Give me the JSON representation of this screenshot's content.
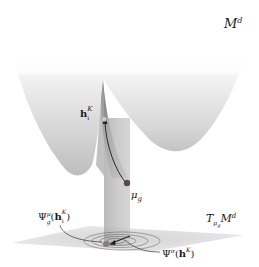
{
  "figure": {
    "manifold_label": {
      "main": "M",
      "sup": "d"
    },
    "tangent_label": {
      "main": "T",
      "sub_mu": "μ",
      "sub_g": "g",
      "M": "M",
      "sup": "d"
    },
    "point_h": {
      "main": "h",
      "sub": "i",
      "sup": "K"
    },
    "point_mu": {
      "main": "μ",
      "sub": "g"
    },
    "psi_mu": {
      "main": "Ψ",
      "sup": "μ",
      "sub": "g",
      "open": "(",
      "arg": "h",
      "arg_sub": "i",
      "arg_sup": "K",
      "close": ")"
    },
    "psi_sigma": {
      "main": "Ψ",
      "sup": "σ",
      "open": "(",
      "arg": "h",
      "arg_sup": "K",
      "close": ")"
    }
  },
  "colors": {
    "surface_light": "#f2f2f2",
    "surface_mid": "#cfcfcf",
    "surface_dark": "#a8a8a8",
    "cusp": "#8e8e8e",
    "plane": "#dcdcdc",
    "column": "#b5b5b5",
    "point": "#5a4a44",
    "curve": "#2a2a2a"
  }
}
